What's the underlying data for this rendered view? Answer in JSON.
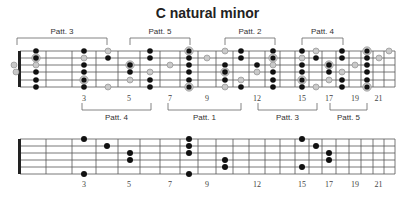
{
  "title": "C natural minor",
  "colors": {
    "line": "#555555",
    "dot": "#111111",
    "hollow": "#c8c8c8",
    "ring": "#999999"
  },
  "fret_x": [
    20,
    46,
    72,
    96,
    118,
    140,
    160,
    180,
    198,
    216,
    233,
    249,
    265,
    280,
    295,
    309,
    322,
    336,
    349,
    361,
    373,
    384,
    395
  ],
  "fret_numbers": [
    "3",
    "5",
    "7",
    "9",
    "12",
    "15",
    "17",
    "19",
    "21"
  ],
  "fret_number_frets": [
    3,
    5,
    7,
    9,
    12,
    15,
    17,
    19,
    21
  ],
  "top_fretboard": {
    "y_strings": [
      51,
      58,
      65,
      72,
      80,
      87
    ],
    "brackets_above": [
      {
        "label": "Patt. 3",
        "x1": 17,
        "x2": 107
      },
      {
        "label": "Patt. 5",
        "x1": 130,
        "x2": 190
      },
      {
        "label": "Patt. 2",
        "x1": 225,
        "x2": 275
      },
      {
        "label": "Patt. 4",
        "x1": 302,
        "x2": 343
      }
    ],
    "brackets_below": [
      {
        "label": "Patt. 4",
        "x1": 82,
        "x2": 151
      },
      {
        "label": "Patt. 1",
        "x1": 168,
        "x2": 241
      },
      {
        "label": "Patt. 3",
        "x1": 258,
        "x2": 317
      },
      {
        "label": "Patt. 5",
        "x1": 330,
        "x2": 367
      }
    ],
    "notes": [
      {
        "x": 14,
        "s": 2,
        "t": "h"
      },
      {
        "x": 16,
        "s": 3,
        "t": "h"
      },
      {
        "x": 36,
        "s": 0,
        "t": "b"
      },
      {
        "x": 36,
        "s": 1,
        "t": "r"
      },
      {
        "x": 36,
        "s": 2,
        "t": "h"
      },
      {
        "x": 36,
        "s": 3,
        "t": "b"
      },
      {
        "x": 36,
        "s": 4,
        "t": "b"
      },
      {
        "x": 36,
        "s": 5,
        "t": "b"
      },
      {
        "x": 84,
        "s": 0,
        "t": "b"
      },
      {
        "x": 84,
        "s": 1,
        "t": "h"
      },
      {
        "x": 84,
        "s": 2,
        "t": "b"
      },
      {
        "x": 84,
        "s": 3,
        "t": "b"
      },
      {
        "x": 84,
        "s": 4,
        "t": "rh"
      },
      {
        "x": 84,
        "s": 5,
        "t": "b"
      },
      {
        "x": 108,
        "s": 0,
        "t": "h"
      },
      {
        "x": 108,
        "s": 1,
        "t": "b"
      },
      {
        "x": 108,
        "s": 5,
        "t": "h"
      },
      {
        "x": 130,
        "s": 2,
        "t": "r"
      },
      {
        "x": 130,
        "s": 3,
        "t": "b"
      },
      {
        "x": 130,
        "s": 4,
        "t": "h"
      },
      {
        "x": 150,
        "s": 0,
        "t": "b"
      },
      {
        "x": 150,
        "s": 1,
        "t": "b"
      },
      {
        "x": 150,
        "s": 3,
        "t": "h"
      },
      {
        "x": 150,
        "s": 4,
        "t": "b"
      },
      {
        "x": 150,
        "s": 5,
        "t": "b"
      },
      {
        "x": 170,
        "s": 2,
        "t": "h"
      },
      {
        "x": 189,
        "s": 0,
        "t": "rh"
      },
      {
        "x": 189,
        "s": 1,
        "t": "b"
      },
      {
        "x": 189,
        "s": 2,
        "t": "b"
      },
      {
        "x": 189,
        "s": 3,
        "t": "b"
      },
      {
        "x": 189,
        "s": 4,
        "t": "b"
      },
      {
        "x": 189,
        "s": 5,
        "t": "rh"
      },
      {
        "x": 207,
        "s": 1,
        "t": "h"
      },
      {
        "x": 225,
        "s": 0,
        "t": "h"
      },
      {
        "x": 225,
        "s": 2,
        "t": "b"
      },
      {
        "x": 225,
        "s": 3,
        "t": "r"
      },
      {
        "x": 225,
        "s": 4,
        "t": "b"
      },
      {
        "x": 225,
        "s": 5,
        "t": "h"
      },
      {
        "x": 241,
        "s": 0,
        "t": "b"
      },
      {
        "x": 241,
        "s": 1,
        "t": "b"
      },
      {
        "x": 241,
        "s": 4,
        "t": "h"
      },
      {
        "x": 241,
        "s": 5,
        "t": "b"
      },
      {
        "x": 257,
        "s": 2,
        "t": "b"
      },
      {
        "x": 257,
        "s": 3,
        "t": "h"
      },
      {
        "x": 273,
        "s": 0,
        "t": "b"
      },
      {
        "x": 273,
        "s": 1,
        "t": "rh"
      },
      {
        "x": 273,
        "s": 2,
        "t": "h"
      },
      {
        "x": 273,
        "s": 3,
        "t": "b"
      },
      {
        "x": 273,
        "s": 4,
        "t": "b"
      },
      {
        "x": 273,
        "s": 5,
        "t": "b"
      },
      {
        "x": 302,
        "s": 0,
        "t": "b"
      },
      {
        "x": 302,
        "s": 1,
        "t": "h"
      },
      {
        "x": 302,
        "s": 2,
        "t": "b"
      },
      {
        "x": 302,
        "s": 3,
        "t": "b"
      },
      {
        "x": 302,
        "s": 4,
        "t": "rh"
      },
      {
        "x": 302,
        "s": 5,
        "t": "b"
      },
      {
        "x": 316,
        "s": 0,
        "t": "h"
      },
      {
        "x": 316,
        "s": 1,
        "t": "b"
      },
      {
        "x": 316,
        "s": 5,
        "t": "h"
      },
      {
        "x": 329,
        "s": 2,
        "t": "r"
      },
      {
        "x": 329,
        "s": 3,
        "t": "b"
      },
      {
        "x": 329,
        "s": 4,
        "t": "h"
      },
      {
        "x": 342,
        "s": 0,
        "t": "b"
      },
      {
        "x": 342,
        "s": 1,
        "t": "b"
      },
      {
        "x": 342,
        "s": 3,
        "t": "h"
      },
      {
        "x": 342,
        "s": 4,
        "t": "b"
      },
      {
        "x": 342,
        "s": 5,
        "t": "b"
      },
      {
        "x": 355,
        "s": 2,
        "t": "h"
      },
      {
        "x": 367,
        "s": 0,
        "t": "rh"
      },
      {
        "x": 367,
        "s": 1,
        "t": "b"
      },
      {
        "x": 367,
        "s": 2,
        "t": "b"
      },
      {
        "x": 367,
        "s": 3,
        "t": "b"
      },
      {
        "x": 367,
        "s": 4,
        "t": "b"
      },
      {
        "x": 367,
        "s": 5,
        "t": "rh"
      },
      {
        "x": 379,
        "s": 1,
        "t": "h"
      },
      {
        "x": 389,
        "s": 0,
        "t": "h"
      }
    ],
    "number_y": 101
  },
  "bottom_fretboard": {
    "y_strings": [
      139,
      146,
      153,
      160,
      167,
      174
    ],
    "notes": [
      {
        "x": 84,
        "s": 0
      },
      {
        "x": 84,
        "s": 5
      },
      {
        "x": 107,
        "s": 1
      },
      {
        "x": 130,
        "s": 2
      },
      {
        "x": 130,
        "s": 3
      },
      {
        "x": 189,
        "s": 0
      },
      {
        "x": 189,
        "s": 1
      },
      {
        "x": 189,
        "s": 2
      },
      {
        "x": 189,
        "s": 5
      },
      {
        "x": 225,
        "s": 3
      },
      {
        "x": 225,
        "s": 4
      },
      {
        "x": 302,
        "s": 0
      },
      {
        "x": 302,
        "s": 4
      },
      {
        "x": 316,
        "s": 1
      },
      {
        "x": 329,
        "s": 2
      },
      {
        "x": 329,
        "s": 3
      }
    ],
    "number_y": 187
  }
}
